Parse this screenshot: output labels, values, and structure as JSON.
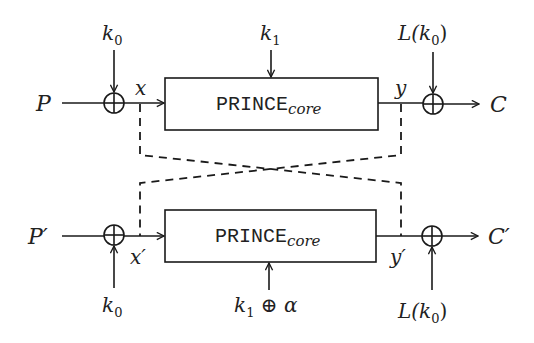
{
  "diagram": {
    "top_row": {
      "input_label": "P",
      "output_label": "C",
      "pre_whitening_key_label": "k",
      "pre_whitening_key_sub": "0",
      "core_key_label": "k",
      "core_key_sub": "1",
      "post_whitening_key_label": "L(k",
      "post_whitening_key_sub": "0",
      "post_whitening_key_close": ")",
      "intermediate_in": "x",
      "intermediate_out": "y",
      "core_box_main": "PRINCE",
      "core_box_sub": "core"
    },
    "bottom_row": {
      "input_label": "P′",
      "output_label": "C′",
      "pre_whitening_key_label": "k",
      "pre_whitening_key_sub": "0",
      "core_key_label": "k",
      "core_key_sub": "1",
      "core_key_suffix": " ⊕ α",
      "post_whitening_key_label": "L(k",
      "post_whitening_key_sub": "0",
      "post_whitening_key_close": ")",
      "intermediate_in": "x′",
      "intermediate_out": "y′",
      "core_box_main": "PRINCE",
      "core_box_sub": "core"
    },
    "connectors": {
      "xor_symbol": "xor-circle",
      "cross_links": "dashed lines linking x↔y′ and y↔x′"
    },
    "colors": {
      "stroke": "#1a1a1a",
      "background": "#ffffff"
    }
  }
}
